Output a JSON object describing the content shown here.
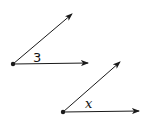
{
  "angles": [
    {
      "label": "3"
    },
    {
      "label": "x"
    }
  ],
  "colors": {
    "stroke": "#1a1a1a"
  }
}
